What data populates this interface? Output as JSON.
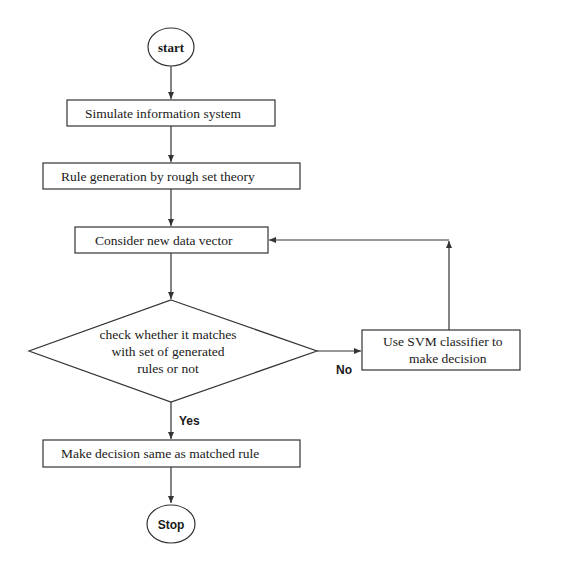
{
  "caption": "Fig. — Flowchart of proposed hybrid rough set / SVM decision approach",
  "nodes": {
    "start": "start",
    "simulate": "Simulate information system",
    "rulegen": "Rule generation by rough set theory",
    "consider": "Consider new data vector",
    "check": [
      "check whether it matches",
      "with set of generated",
      "rules or not"
    ],
    "svm": [
      "Use SVM classifier to",
      "make decision"
    ],
    "decide": "Make decision same as matched rule",
    "stop": "Stop"
  },
  "edges": {
    "yes_label": "Yes",
    "no_label": "No"
  },
  "colors": {
    "stroke": "#333333",
    "text": "#1a1a1a",
    "background": "#ffffff"
  }
}
